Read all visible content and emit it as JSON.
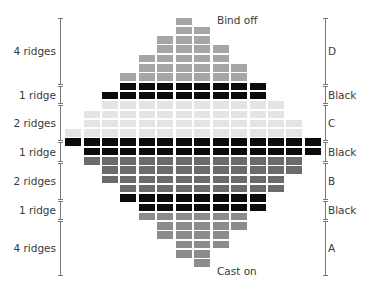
{
  "diagram": {
    "type": "knitting-stripe-chart",
    "colors": {
      "A": "#8c8c8c",
      "B": "#6b6b6b",
      "C": "#e4e4e4",
      "D": "#a6a6a6",
      "Black": "#0b0b0b"
    },
    "annotations": {
      "top": "Bind off",
      "bottom": "Cast on"
    },
    "rows_top_to_bottom": [
      {
        "section": "D",
        "start": 6,
        "end": 6
      },
      {
        "section": "D",
        "start": 6,
        "end": 7
      },
      {
        "section": "D",
        "start": 5,
        "end": 7
      },
      {
        "section": "D",
        "start": 5,
        "end": 8
      },
      {
        "section": "D",
        "start": 4,
        "end": 8
      },
      {
        "section": "D",
        "start": 4,
        "end": 9
      },
      {
        "section": "D",
        "start": 3,
        "end": 9
      },
      {
        "section": "Black",
        "start": 3,
        "end": 10
      },
      {
        "section": "Black",
        "start": 2,
        "end": 10
      },
      {
        "section": "C",
        "start": 2,
        "end": 11
      },
      {
        "section": "C",
        "start": 1,
        "end": 11
      },
      {
        "section": "C",
        "start": 1,
        "end": 12
      },
      {
        "section": "C",
        "start": 0,
        "end": 12
      },
      {
        "section": "Black",
        "start": 0,
        "end": 13
      },
      {
        "section": "Black",
        "start": 1,
        "end": 13
      },
      {
        "section": "B",
        "start": 1,
        "end": 12
      },
      {
        "section": "B",
        "start": 2,
        "end": 12
      },
      {
        "section": "B",
        "start": 2,
        "end": 11
      },
      {
        "section": "B",
        "start": 3,
        "end": 11
      },
      {
        "section": "Black",
        "start": 3,
        "end": 10
      },
      {
        "section": "Black",
        "start": 4,
        "end": 10
      },
      {
        "section": "A",
        "start": 4,
        "end": 9
      },
      {
        "section": "A",
        "start": 5,
        "end": 9
      },
      {
        "section": "A",
        "start": 5,
        "end": 8
      },
      {
        "section": "A",
        "start": 6,
        "end": 8
      },
      {
        "section": "A",
        "start": 6,
        "end": 7
      },
      {
        "section": "A",
        "start": 7,
        "end": 7
      }
    ],
    "left_labels": [
      {
        "text": "4 ridges",
        "top": 18,
        "bottom": 84
      },
      {
        "text": "1 ridge",
        "top": 86,
        "bottom": 103
      },
      {
        "text": "2 ridges",
        "top": 105,
        "bottom": 140
      },
      {
        "text": "1 ridge",
        "top": 142,
        "bottom": 161
      },
      {
        "text": "2 ridges",
        "top": 163,
        "bottom": 199
      },
      {
        "text": "1 ridge",
        "top": 201,
        "bottom": 219
      },
      {
        "text": "4 ridges",
        "top": 221,
        "bottom": 275
      }
    ],
    "right_labels": [
      {
        "text": "D",
        "top": 18,
        "bottom": 84
      },
      {
        "text": "Black",
        "top": 86,
        "bottom": 103
      },
      {
        "text": "C",
        "top": 105,
        "bottom": 140
      },
      {
        "text": "Black",
        "top": 142,
        "bottom": 161
      },
      {
        "text": "B",
        "top": 163,
        "bottom": 199
      },
      {
        "text": "Black",
        "top": 201,
        "bottom": 219
      },
      {
        "text": "A",
        "top": 221,
        "bottom": 275
      }
    ]
  }
}
